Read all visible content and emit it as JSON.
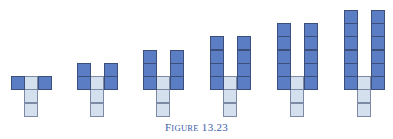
{
  "figure": {
    "caption_prefix": "F",
    "caption_small": "IGURE",
    "caption_number": "13.23",
    "colors": {
      "blue": "#5b7dc4",
      "light": "#d5e0ef",
      "caption": "#3c5ea8"
    },
    "stages": [
      {
        "blue_per_arm": 1,
        "x": 11
      },
      {
        "blue_per_arm": 2,
        "x": 77
      },
      {
        "blue_per_arm": 3,
        "x": 143
      },
      {
        "blue_per_arm": 4,
        "x": 210
      },
      {
        "blue_per_arm": 5,
        "x": 277
      },
      {
        "blue_per_arm": 6,
        "x": 344
      }
    ],
    "stem_light_cells": 3
  }
}
